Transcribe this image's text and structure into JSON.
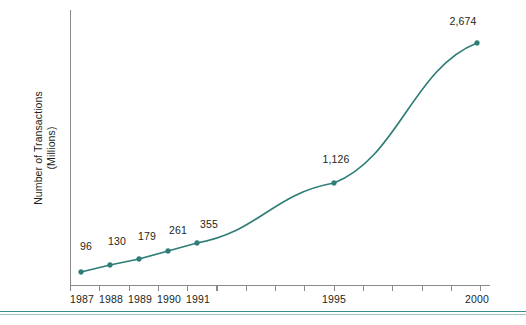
{
  "chart_data": {
    "type": "line",
    "title": "",
    "subtitle": "",
    "xlabel": "",
    "ylabel": "Number of Transactions (Millions)",
    "ylabel_line1": "Number of Transactions",
    "ylabel_line2": "(Millions)",
    "categories": [
      "1987",
      "1988",
      "1989",
      "1990",
      "1991",
      "1995",
      "2000"
    ],
    "x": [
      1987,
      1988,
      1989,
      1990,
      1991,
      1995,
      2000
    ],
    "values": [
      96,
      130,
      179,
      261,
      355,
      1126,
      2674
    ],
    "point_labels": [
      "96",
      "130",
      "179",
      "261",
      "355",
      "1,126",
      "2,674"
    ],
    "tick_labels": [
      "1987",
      "1988",
      "1989",
      "1990",
      "1991",
      "1995",
      "2000"
    ],
    "all_tick_years": [
      1987,
      1988,
      1989,
      1990,
      1991,
      1992,
      1993,
      1994,
      1995,
      1996,
      1997,
      1998,
      1999,
      2000
    ],
    "xlim": [
      1987,
      2000
    ],
    "ylim": [
      0,
      2900
    ],
    "grid": false,
    "legend": false,
    "legend_position": "none",
    "series": [
      {
        "name": "Number of Transactions",
        "values": [
          96,
          130,
          179,
          261,
          355,
          1126,
          2674
        ],
        "color": "#2e7d77"
      }
    ],
    "annotations": []
  },
  "style": {
    "line_color": "#2e7d77",
    "marker_color": "#2e7d77",
    "axis_color": "#8a8a8a",
    "text_color": "#231f20",
    "rule_color": "#3a8f8a",
    "background": "#ffffff"
  },
  "geometry": {
    "points_px": [
      {
        "label": "96",
        "x": 81,
        "y": 272,
        "lx": 86,
        "ly": 250
      },
      {
        "label": "130",
        "x": 110,
        "y": 265,
        "lx": 117,
        "ly": 245
      },
      {
        "label": "179",
        "x": 139,
        "y": 259,
        "lx": 147,
        "ly": 240
      },
      {
        "label": "261",
        "x": 168,
        "y": 251,
        "lx": 178,
        "ly": 234
      },
      {
        "label": "355",
        "x": 197,
        "y": 243,
        "lx": 209,
        "ly": 228
      },
      {
        "label": "1,126",
        "x": 334,
        "y": 183,
        "lx": 336,
        "ly": 163
      },
      {
        "label": "2,674",
        "x": 477,
        "y": 43,
        "lx": 463,
        "ly": 25
      }
    ],
    "ticks_px": [
      70,
      99.3,
      128.6,
      157.9,
      187.2,
      216.5,
      245.8,
      275.1,
      304.4,
      333.7,
      363,
      392.3,
      421.6,
      450.9,
      480.2
    ],
    "tick_label_px": [
      {
        "text": "1987",
        "x": 82
      },
      {
        "text": "1988",
        "x": 111
      },
      {
        "text": "1989",
        "x": 140
      },
      {
        "text": "1990",
        "x": 169
      },
      {
        "text": "1991",
        "x": 198
      },
      {
        "text": "1995",
        "x": 334
      },
      {
        "text": "2000",
        "x": 477
      }
    ],
    "axis_x_px": 70,
    "axis_top_px": 10,
    "axis_baseline_px": 285,
    "axis_right_px": 490,
    "rule_y_px": 312
  }
}
